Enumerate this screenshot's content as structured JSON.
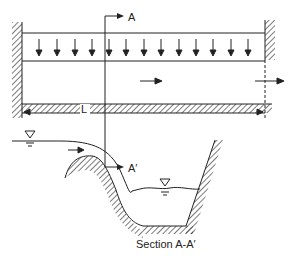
{
  "diagram": {
    "plan_view": {
      "section_label_top": "A",
      "section_label_bottom": "A′",
      "length_label": "L",
      "lateral_inflow_arrows": 14,
      "flow_direction": "right"
    },
    "section_view": {
      "caption": "Section A-A′",
      "water_surface_symbol": "▽"
    },
    "colors": {
      "line": "#222222",
      "background": "#ffffff"
    }
  }
}
